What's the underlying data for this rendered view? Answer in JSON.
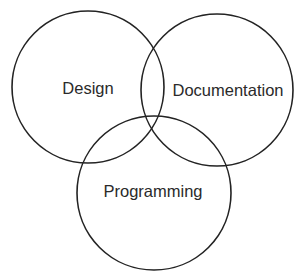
{
  "diagram": {
    "type": "venn",
    "background": "#ffffff",
    "stroke_color": "#232323",
    "text_color": "#2a2a2a",
    "sets": [
      {
        "label": "Design",
        "cx": 88,
        "cy": 87,
        "r": 76,
        "label_x": 88,
        "label_y": 94
      },
      {
        "label": "Documentation",
        "cx": 217,
        "cy": 90,
        "r": 76,
        "label_x": 228,
        "label_y": 96
      },
      {
        "label": "Programming",
        "cx": 154,
        "cy": 193,
        "r": 77,
        "label_x": 153,
        "label_y": 197
      }
    ]
  }
}
